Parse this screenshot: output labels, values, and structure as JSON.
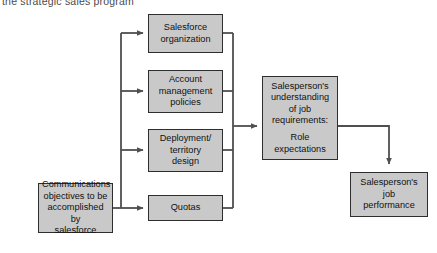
{
  "caption": {
    "text": "the strategic sales program"
  },
  "colors": {
    "node_fill": "#c9c9c9",
    "node_border": "#2e2e2e",
    "connector": "#4f4f4f",
    "text": "#111111",
    "caption_text": "#4a4a4a",
    "background": "#ffffff"
  },
  "nodes": {
    "source": {
      "line1": "Communications",
      "line2": "objectives to be",
      "line3": "accomplished by",
      "line4": "salesforce"
    },
    "salesforce_organization": {
      "line1": "Salesforce",
      "line2": "organization"
    },
    "account_management_policies": {
      "line1": "Account",
      "line2": "management",
      "line3": "policies"
    },
    "deployment_territory_design": {
      "line1": "Deployment/",
      "line2": "territory",
      "line3": "design"
    },
    "quotas": {
      "line1": "Quotas"
    },
    "role_expectations": {
      "line1": "Salesperson's",
      "line2": "understanding",
      "line3": "of job",
      "line4": "requirements:",
      "line5": "Role",
      "line6": "expectations"
    },
    "job_performance": {
      "line1": "Salesperson's",
      "line2": "job",
      "line3": "performance"
    }
  }
}
